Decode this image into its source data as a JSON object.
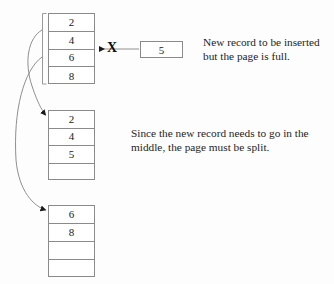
{
  "diagram": {
    "background_color": "#fdfdfd",
    "line_color": "#8a8a8a",
    "text_color": "#1d1d1d"
  },
  "pages": [
    {
      "name": "original-full-page",
      "label": "Original page (full)",
      "x": 48,
      "y": 13,
      "width": 47,
      "height": 71,
      "rows": [
        "2",
        "4",
        "6",
        "8"
      ]
    },
    {
      "name": "left-split-page",
      "label": "Left page after split",
      "x": 48,
      "y": 110,
      "width": 47,
      "height": 70,
      "rows": [
        "2",
        "4",
        "5",
        ""
      ]
    },
    {
      "name": "right-split-page",
      "label": "Right page after split",
      "x": 48,
      "y": 205,
      "width": 47,
      "height": 72,
      "rows": [
        "6",
        "8",
        "",
        ""
      ]
    }
  ],
  "new_record": {
    "name": "new-record-box",
    "value": "5",
    "x": 140,
    "y": 41,
    "width": 43,
    "height": 17
  },
  "blocked_marker": {
    "name": "insertion-blocked-x",
    "symbol": "X",
    "x": 107,
    "y": 41
  },
  "captions": [
    {
      "name": "caption-page-full",
      "text": "New record to be inserted\nbut the page is full.",
      "x": 203,
      "y": 35
    },
    {
      "name": "caption-page-split",
      "text": "Since the new record needs to go in the\nmiddle, the page must be split.",
      "x": 131,
      "y": 126
    }
  ],
  "connectors": [
    {
      "name": "insert-attempt-arrow",
      "from": "new-record-box",
      "to": "original-full-page",
      "blocked": true
    },
    {
      "name": "split-arrow-to-left-page",
      "from": "original-full-page",
      "to": "left-split-page"
    },
    {
      "name": "split-arrow-to-right-page",
      "from": "original-full-page",
      "to": "right-split-page"
    }
  ],
  "bracket": {
    "name": "source-page-bracket",
    "x": 42,
    "y": 13,
    "height": 71
  }
}
